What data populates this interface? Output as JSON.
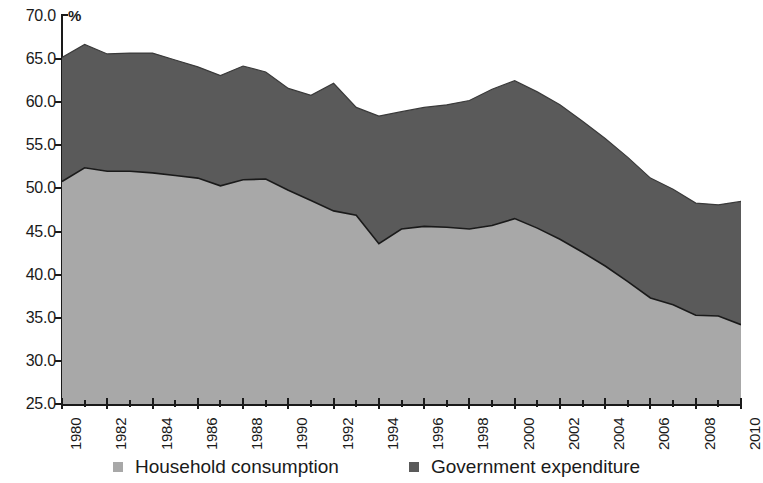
{
  "chart_data": {
    "type": "area",
    "stacked": true,
    "title": "",
    "subtitle": "",
    "xlabel": "",
    "ylabel": "",
    "unit_label": "%",
    "ylim": [
      25.0,
      70.0
    ],
    "ytick_step": 5.0,
    "grid": false,
    "legend_position": "bottom",
    "xlim": [
      1980,
      2010
    ],
    "xtick_step": 2,
    "x": [
      1980,
      1981,
      1982,
      1983,
      1984,
      1985,
      1986,
      1987,
      1988,
      1989,
      1990,
      1991,
      1992,
      1993,
      1994,
      1995,
      1996,
      1997,
      1998,
      1999,
      2000,
      2001,
      2002,
      2003,
      2004,
      2005,
      2006,
      2007,
      2008,
      2009,
      2010
    ],
    "x_tick_labels": [
      "1980",
      "1982",
      "1984",
      "1986",
      "1988",
      "1990",
      "1992",
      "1994",
      "1996",
      "1998",
      "2000",
      "2002",
      "2004",
      "2006",
      "2008",
      "2010"
    ],
    "y_tick_labels": [
      "70.0",
      "65.0",
      "60.0",
      "55.0",
      "50.0",
      "45.0",
      "40.0",
      "35.0",
      "30.0",
      "25.0"
    ],
    "y_tick_values": [
      70.0,
      65.0,
      60.0,
      55.0,
      50.0,
      45.0,
      40.0,
      35.0,
      30.0,
      25.0
    ],
    "series": [
      {
        "name": "Household consumption",
        "color": "#a8a8a8",
        "values": [
          50.8,
          52.4,
          52.0,
          52.0,
          51.8,
          51.5,
          51.2,
          50.3,
          51.0,
          51.1,
          49.8,
          48.6,
          47.4,
          46.9,
          43.6,
          45.3,
          45.6,
          45.5,
          45.3,
          45.7,
          46.5,
          45.4,
          44.1,
          42.6,
          41.0,
          39.2,
          37.3,
          36.5,
          35.3,
          35.2,
          34.2
        ]
      },
      {
        "name": "Government expenditure",
        "color": "#5a5a5a",
        "values": [
          14.4,
          14.3,
          13.6,
          13.7,
          13.9,
          13.4,
          12.9,
          12.8,
          13.2,
          12.4,
          11.8,
          12.2,
          14.8,
          12.5,
          14.8,
          13.6,
          13.8,
          14.2,
          14.9,
          15.8,
          16.0,
          15.8,
          15.6,
          15.2,
          14.8,
          14.4,
          13.9,
          13.4,
          13.0,
          12.9,
          14.3
        ]
      }
    ],
    "totals": [
      65.2,
      66.7,
      65.6,
      65.7,
      65.7,
      64.9,
      64.1,
      63.1,
      64.2,
      63.5,
      61.6,
      60.8,
      62.2,
      59.4,
      58.4,
      58.9,
      59.4,
      59.7,
      60.2,
      61.5,
      62.5,
      61.2,
      59.7,
      57.8,
      55.8,
      53.6,
      51.2,
      49.9,
      48.3,
      48.1,
      48.5
    ]
  },
  "legend": {
    "items": [
      {
        "label": "Household consumption",
        "color": "#a8a8a8"
      },
      {
        "label": "Government expenditure",
        "color": "#5a5a5a"
      }
    ]
  },
  "axes": {
    "unit": "%"
  }
}
